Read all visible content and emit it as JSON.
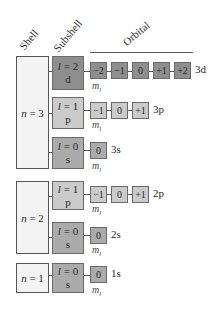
{
  "headers": {
    "shell": "Shell",
    "subshell": "Subshell",
    "orbital": "Orbital"
  },
  "ml_label": "m",
  "ml_sub": "l",
  "shells": [
    {
      "label_var": "n",
      "label": " = 3"
    },
    {
      "label_var": "n",
      "label": " = 2"
    },
    {
      "label_var": "n",
      "label": " = 1"
    }
  ],
  "rows": [
    {
      "l_var": "l",
      "l": " = 2",
      "letter": "d",
      "orbitals": [
        "−2",
        "−1",
        "0",
        "+1",
        "+2"
      ],
      "name": "3d"
    },
    {
      "l_var": "l",
      "l": " = 1",
      "letter": "p",
      "orbitals": [
        "−1",
        "0",
        "+1"
      ],
      "name": "3p"
    },
    {
      "l_var": "l",
      "l": " = 0",
      "letter": "s",
      "orbitals": [
        "0"
      ],
      "name": "3s"
    },
    {
      "l_var": "l",
      "l": " = 1",
      "letter": "p",
      "orbitals": [
        "−1",
        "0",
        "+1"
      ],
      "name": "2p"
    },
    {
      "l_var": "l",
      "l": " = 0",
      "letter": "s",
      "orbitals": [
        "0"
      ],
      "name": "2s"
    },
    {
      "l_var": "l",
      "l": " = 0",
      "letter": "s",
      "orbitals": [
        "0"
      ],
      "name": "1s"
    }
  ],
  "colors": {
    "d": "#8e8e8e",
    "p": "#cbcbcb",
    "s": "#ababab",
    "shell": "#f3f3f3"
  }
}
